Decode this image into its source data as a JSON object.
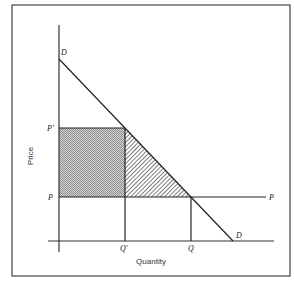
{
  "diagram": {
    "type": "economics-supply-demand",
    "axes": {
      "x_label": "Quantity",
      "y_label": "Price"
    },
    "labels": {
      "demand_top": "D",
      "demand_bottom": "D",
      "price_high": "P'",
      "price_low": "P",
      "price_line_end": "P",
      "quantity_low": "Q'",
      "quantity_high": "Q"
    },
    "regions": {
      "rectangle": {
        "description": "shaded rectangle between P' and P, from origin to Q'",
        "fill": "dotted-gray"
      },
      "triangle": {
        "description": "hatched triangle between P' and P, from Q' to demand curve",
        "fill": "diagonal-hatch"
      }
    },
    "colors": {
      "line": "#2a2a2a",
      "border": "#444444",
      "shade": "#9a9a9a"
    }
  }
}
